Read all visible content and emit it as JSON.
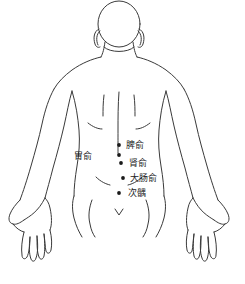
{
  "figure": {
    "view": "posterior",
    "outline_color": "#3a3a3a",
    "text_color": "#242424",
    "point_color": "#1a1a1a",
    "background_color": "#ffffff",
    "width": 245,
    "height": 284
  },
  "acupoints": [
    {
      "id": "pishu",
      "label": "脾俞",
      "side": "right",
      "dot": {
        "x": 119,
        "y": 145
      },
      "text": {
        "x": 126,
        "y": 140
      }
    },
    {
      "id": "weishu",
      "label": "胃俞",
      "side": "left",
      "dot": {
        "x": 119,
        "y": 155
      },
      "text": {
        "x": 92,
        "y": 151
      }
    },
    {
      "id": "shenshu",
      "label": "肾俞",
      "side": "right",
      "dot": {
        "x": 121,
        "y": 163
      },
      "text": {
        "x": 129,
        "y": 158
      }
    },
    {
      "id": "dachangshu",
      "label": "大肠俞",
      "side": "right",
      "dot": {
        "x": 123,
        "y": 178
      },
      "text": {
        "x": 130,
        "y": 173
      }
    },
    {
      "id": "ciliao",
      "label": "次髃",
      "side": "right",
      "dot": {
        "x": 119,
        "y": 193
      },
      "text": {
        "x": 128,
        "y": 188
      }
    }
  ]
}
